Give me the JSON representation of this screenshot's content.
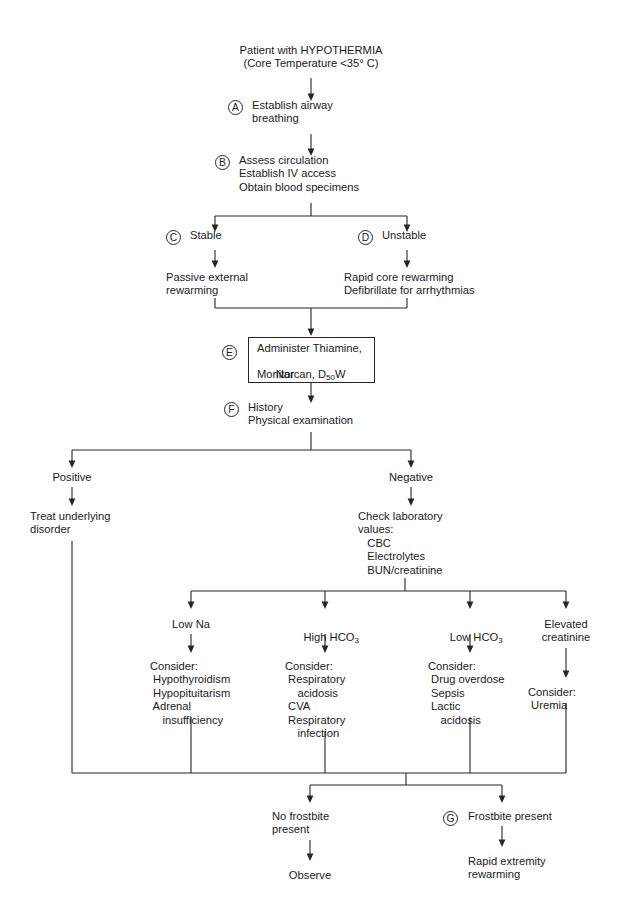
{
  "diagram": {
    "type": "clinical-flowchart",
    "line_color": "#262626",
    "background": "#ffffff"
  },
  "nodes": {
    "start": "Patient with HYPOTHERMIA\n(Core Temperature <35° C)",
    "a_text": "Establish airway\nbreathing",
    "b_text": "Assess circulation\nEstablish IV access\nObtain blood specimens",
    "c_text": "Stable",
    "d_text": "Unstable",
    "passive": "Passive external\nrewarming",
    "rapid": "Rapid core rewarming\nDefibrillate for arrhythmias",
    "e_line1": "Administer Thiamine,",
    "e_line2": "Narcan, D",
    "e_sub": "50",
    "e_line2b": "W",
    "e_line3": "Monitor",
    "f_text": "History\nPhysical examination",
    "positive": "Positive",
    "negative": "Negative",
    "treat": "Treat underlying\ndisorder",
    "check_lab": "Check laboratory\nvalues:\n   CBC\n   Electrolytes\n   BUN/creatinine",
    "low_na": "Low Na",
    "high_hco3_pre": "High HCO",
    "high_hco3_sub": "3",
    "low_hco3_pre": "Low HCO",
    "low_hco3_sub": "3",
    "elevated_creatinine": "Elevated\ncreatinine",
    "consider_na": "Consider:\n Hypothyroidism\n Hypopituitarism\n Adrenal\n    insufficiency",
    "consider_high_hco3": "Consider:\n Respiratory\n    acidosis\n CVA\n Respiratory\n    infection",
    "consider_low_hco3": "Consider:\n Drug overdose\n Sepsis\n Lactic\n    acidosis",
    "consider_creat": "Consider:\n Uremia",
    "no_frostbite": "No frostbite\npresent",
    "frostbite_present": "Frostbite present",
    "observe": "Observe",
    "rapid_extremity": "Rapid extremity\nrewarming"
  },
  "badges": {
    "a": "A",
    "b": "B",
    "c": "C",
    "d": "D",
    "e": "E",
    "f": "F",
    "g": "G"
  }
}
